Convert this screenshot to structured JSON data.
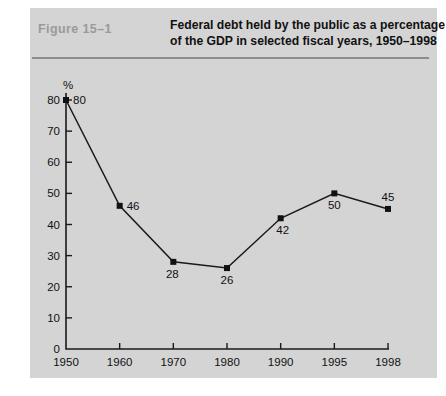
{
  "figure": {
    "label": "Figure  15–1",
    "title_line1": "Federal debt held by the public as a percentage",
    "title_line2": "of the GDP in selected fiscal years, 1950–1998",
    "panel_color": "#d4d4d4",
    "rule_color": "#8d8d8d",
    "label_color": "#9a9a9a",
    "ink_color": "#111111"
  },
  "chart_data": {
    "type": "line",
    "title": "Federal debt held by the public as a percentage of the GDP in selected fiscal years, 1950–1998",
    "categories": [
      "1950",
      "1960",
      "1970",
      "1980",
      "1990",
      "1995",
      "1998"
    ],
    "values": [
      80,
      46,
      28,
      26,
      42,
      50,
      45
    ],
    "point_labels": [
      "80",
      "46",
      "28",
      "26",
      "42",
      "50",
      "45"
    ],
    "point_label_positions": [
      "right",
      "right",
      "below-left",
      "below",
      "below-right",
      "below",
      "above"
    ],
    "xlabel": "",
    "ylabel": "%",
    "ylim": [
      0,
      80
    ],
    "y_ticks": [
      0,
      10,
      20,
      30,
      40,
      50,
      60,
      70,
      80
    ],
    "y_tick_labels": [
      "0",
      "10",
      "20",
      "30",
      "40",
      "50",
      "60",
      "70",
      "80"
    ],
    "x_tick_labels": [
      "1950",
      "1960",
      "1970",
      "1980",
      "1990",
      "1995",
      "1998"
    ],
    "grid": false,
    "legend": false,
    "marker": "square",
    "line_color": "#111111",
    "marker_color": "#111111"
  }
}
